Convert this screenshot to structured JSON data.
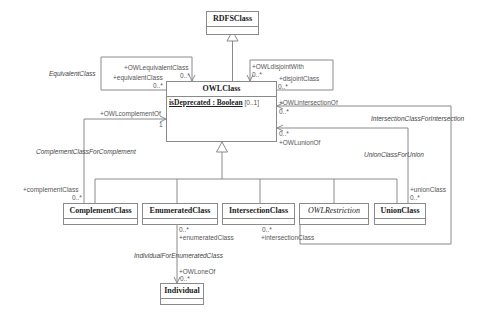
{
  "diagram": {
    "type": "UML class diagram",
    "classes": {
      "rdfs_class": {
        "name": "RDFSClass"
      },
      "owl_class": {
        "name": "OWLClass",
        "attribute_name": "isDeprecated : Boolean",
        "attribute_mult": "[0..1]"
      },
      "complement_class": {
        "name": "ComplementClass"
      },
      "enumerated_class": {
        "name": "EnumeratedClass"
      },
      "intersection_class": {
        "name": "IntersectionClass"
      },
      "owl_restriction": {
        "name": "OWLRestriction"
      },
      "union_class": {
        "name": "UnionClass"
      },
      "individual": {
        "name": "Individual"
      }
    },
    "associations": {
      "equivalent": {
        "name": "EquivalentClass",
        "role1": "+OWLequivalentClass",
        "mult1": "0..*",
        "role2": "+equivalentClass",
        "mult2": "0..*"
      },
      "disjoint": {
        "role1": "+OWLdisjointWith",
        "mult1": "0..*",
        "role2": "+disjointClass",
        "mult2": "0..*"
      },
      "complement": {
        "name": "ComplementClassForComplement",
        "role1": "+OWLcomplementOf",
        "mult1": "1",
        "role2": "+complementClass",
        "mult2": "0..*"
      },
      "intersection": {
        "name": "IntersectionClassForIntersection",
        "role1": "+OWLintersectionOf",
        "mult1": "0..*",
        "role2": "+intersectionClass",
        "mult2": "0..*"
      },
      "union": {
        "name": "UnionClassForUnion",
        "role1": "+OWLunionOf",
        "mult1": "0..*",
        "role2": "+unionClass",
        "mult2": "0..*"
      },
      "enumerated": {
        "name": "IndividualForEnumeratedClass",
        "role1": "+enumeratedClass",
        "mult1": "0..*",
        "role2": "+OWLoneOf",
        "mult2": "0..*"
      }
    }
  }
}
